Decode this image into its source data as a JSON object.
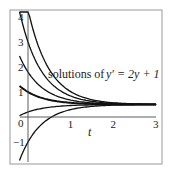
{
  "chart_data": {
    "type": "line",
    "title_prefix": "solutions of",
    "title_eq": "y′ = 2y + 1",
    "xlabel": "t",
    "ylabel": "",
    "xlim": [
      -0.2,
      3
    ],
    "ylim": [
      -1.8,
      4.2
    ],
    "xticks": [
      "1",
      "2",
      "3"
    ],
    "yticks": [
      "4",
      "3",
      "2",
      "1",
      "0",
      "−1"
    ],
    "equilibrium": 0.5,
    "rate": 2,
    "series": [
      {
        "name": "y0=4.3",
        "y0": 4.3
      },
      {
        "name": "y0=3",
        "y0": 3.0
      },
      {
        "name": "y0=1.8",
        "y0": 1.8
      },
      {
        "name": "y0=1",
        "y0": 1.0
      },
      {
        "name": "y0=0.2",
        "y0": 0.2
      },
      {
        "name": "y0=-1",
        "y0": -1.0
      }
    ]
  }
}
